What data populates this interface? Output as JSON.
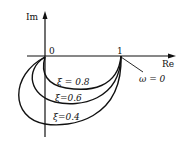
{
  "diagram": {
    "axes": {
      "y_label": "Im",
      "x_label": "Re",
      "origin_label": "0",
      "unit_label": "1"
    },
    "annotation": "ω = 0",
    "curves": [
      {
        "label": "ξ = 0.8",
        "zeta": 0.8
      },
      {
        "label": "ξ=0.6",
        "zeta": 0.6
      },
      {
        "label": "ξ=0.4",
        "zeta": 0.4
      }
    ],
    "colors": {
      "stroke": "#111111",
      "background": "#ffffff"
    }
  }
}
